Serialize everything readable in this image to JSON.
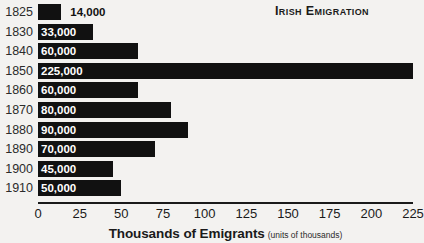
{
  "chart_data": {
    "type": "bar",
    "orientation": "horizontal",
    "title": "Irish Emigration",
    "xlabel": "Thousands of Emigrants",
    "xlabel_note": "(units of thousands)",
    "ylabel": "",
    "xlim": [
      0,
      225
    ],
    "xticks": [
      0,
      25,
      50,
      75,
      100,
      125,
      150,
      175,
      200,
      225
    ],
    "xtick_labels": [
      "0",
      "25",
      "50",
      "75",
      "100",
      "125",
      "150",
      "175",
      "200",
      "225"
    ],
    "grid": false,
    "legend": false,
    "bar_color": "#111111",
    "background_color": "#f3f2f0",
    "categories": [
      "1825",
      "1830",
      "1840",
      "1850",
      "1860",
      "1870",
      "1880",
      "1890",
      "1900",
      "1910"
    ],
    "values": [
      14,
      33,
      60,
      225,
      60,
      80,
      90,
      70,
      45,
      50
    ],
    "data_labels": [
      "14,000",
      "33,000",
      "60,000",
      "225,000",
      "60,000",
      "80,000",
      "90,000",
      "70,000",
      "45,000",
      "50,000"
    ],
    "rows": [
      {
        "year": "1825",
        "value": 14,
        "label": "14,000",
        "label_position": "outside"
      },
      {
        "year": "1830",
        "value": 33,
        "label": "33,000",
        "label_position": "inside"
      },
      {
        "year": "1840",
        "value": 60,
        "label": "60,000",
        "label_position": "inside"
      },
      {
        "year": "1850",
        "value": 225,
        "label": "225,000",
        "label_position": "inside"
      },
      {
        "year": "1860",
        "value": 60,
        "label": "60,000",
        "label_position": "inside"
      },
      {
        "year": "1870",
        "value": 80,
        "label": "80,000",
        "label_position": "inside"
      },
      {
        "year": "1880",
        "value": 90,
        "label": "90,000",
        "label_position": "inside"
      },
      {
        "year": "1890",
        "value": 70,
        "label": "70,000",
        "label_position": "inside"
      },
      {
        "year": "1900",
        "value": 45,
        "label": "45,000",
        "label_position": "inside"
      },
      {
        "year": "1910",
        "value": 50,
        "label": "50,000",
        "label_position": "inside"
      }
    ]
  }
}
